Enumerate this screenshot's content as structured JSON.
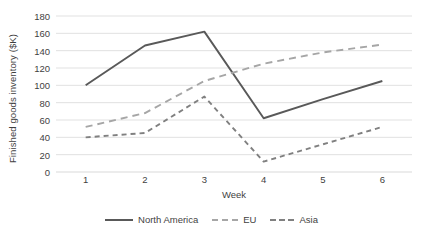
{
  "chart_data": {
    "type": "line",
    "title": "",
    "xlabel": "Week",
    "ylabel": "Finished goods inventory ($K)",
    "categories": [
      "1",
      "2",
      "3",
      "4",
      "5",
      "6"
    ],
    "x": [
      1,
      2,
      3,
      4,
      5,
      6
    ],
    "xlim": [
      0.5,
      6.5
    ],
    "ylim": [
      0,
      180
    ],
    "y_ticks": [
      0,
      20,
      40,
      60,
      80,
      100,
      120,
      140,
      160,
      180
    ],
    "grid": true,
    "legend_position": "bottom",
    "series": [
      {
        "name": "North America",
        "values": [
          100,
          146,
          162,
          62,
          84,
          105
        ],
        "color": "#595959",
        "style": "solid",
        "dash": "none"
      },
      {
        "name": "EU",
        "values": [
          52,
          68,
          105,
          125,
          138,
          147
        ],
        "color": "#a6a6a6",
        "style": "dashed",
        "dash": "long"
      },
      {
        "name": "Asia",
        "values": [
          40,
          45,
          87,
          12,
          32,
          52
        ],
        "color": "#808080",
        "style": "dashed",
        "dash": "short"
      }
    ]
  },
  "axis": {
    "y_title": "Finished goods inventory ($K)",
    "x_title": "Week",
    "y_tick_labels": [
      "180",
      "160",
      "140",
      "120",
      "100",
      "80",
      "60",
      "40",
      "20",
      "0"
    ],
    "x_tick_labels": [
      "1",
      "2",
      "3",
      "4",
      "5",
      "6"
    ]
  },
  "legend": {
    "items": [
      {
        "label": "North America",
        "color": "#595959",
        "dash": "none"
      },
      {
        "label": "EU",
        "color": "#a6a6a6",
        "dash": "long"
      },
      {
        "label": "Asia",
        "color": "#808080",
        "dash": "short"
      }
    ]
  },
  "colors": {
    "grid": "#d9d9d9",
    "text": "#3f3f3f",
    "background": "#ffffff",
    "north_america": "#595959",
    "eu": "#a6a6a6",
    "asia": "#808080"
  }
}
